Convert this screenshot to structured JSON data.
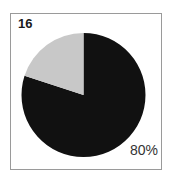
{
  "panel": {
    "label": "16"
  },
  "chart_data": {
    "type": "pie",
    "title": "",
    "categories": [
      "Dark slice",
      "Light slice"
    ],
    "values": [
      80,
      20
    ],
    "labels": [
      "80%",
      ""
    ],
    "colors": [
      "#111111",
      "#c8c8c8"
    ],
    "start_angle_deg": 0,
    "direction": "clockwise from 12 o'clock (dark), light slice occupies 12 o'clock back to ~10 o'clock",
    "legend": "none"
  },
  "annotations": {
    "dark_slice_label": "80%"
  }
}
